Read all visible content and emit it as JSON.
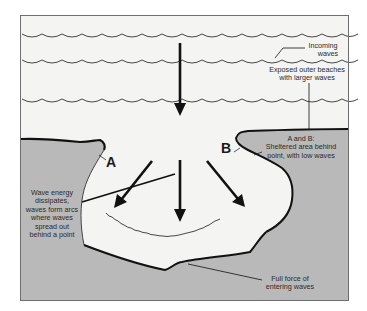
{
  "diagram": {
    "colors": {
      "water": "#f4f4f3",
      "land": "#b9b9b9",
      "frame": "#6e6e6e",
      "line": "#111111",
      "wave": "#333333"
    },
    "labels": {
      "incoming_waves": [
        "Incoming",
        "waves"
      ],
      "exposed_beaches": [
        "Exposed outer beaches",
        "with larger waves"
      ],
      "point_a": "A",
      "point_b": "B",
      "sheltered": [
        "A and B:",
        "Sheltered area behind",
        "point, with low waves"
      ],
      "wave_energy": [
        "Wave energy",
        "dissipates,",
        "waves form arcs",
        "where waves",
        "spread out",
        "behind a point"
      ],
      "full_force": [
        "Full force of",
        "entering waves"
      ]
    },
    "elements": {
      "wave_rows": 3,
      "arrows": [
        "main-incoming-arrow",
        "left-diverging-arrow",
        "center-arrow",
        "right-diverging-arrow"
      ],
      "regions": [
        "open-water",
        "left-headland",
        "right-headland",
        "bay"
      ]
    }
  }
}
